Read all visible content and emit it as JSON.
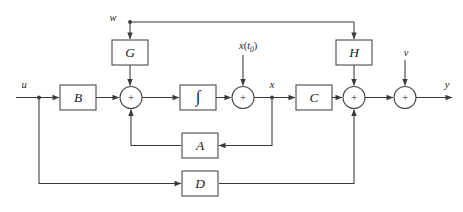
{
  "diagram": {
    "type": "control-block-diagram",
    "colors": {
      "background": "#ffffff",
      "wire": "#3a3a3a",
      "block_stroke": "#4a4a4a",
      "block_fill": "#ffffff",
      "text": "#1d1d1d"
    },
    "blocks": [
      {
        "id": "G",
        "label": "G",
        "x": 112,
        "y": 40,
        "w": 36,
        "h": 25
      },
      {
        "id": "H",
        "label": "H",
        "x": 336,
        "y": 40,
        "w": 36,
        "h": 25
      },
      {
        "id": "B",
        "label": "B",
        "x": 60,
        "y": 85,
        "w": 36,
        "h": 25
      },
      {
        "id": "I",
        "label": "∫",
        "x": 180,
        "y": 85,
        "w": 36,
        "h": 25
      },
      {
        "id": "C",
        "label": "C",
        "x": 296,
        "y": 85,
        "w": 36,
        "h": 25
      },
      {
        "id": "A",
        "label": "A",
        "x": 182,
        "y": 133,
        "w": 36,
        "h": 25
      },
      {
        "id": "D",
        "label": "D",
        "x": 182,
        "y": 171,
        "w": 36,
        "h": 25
      }
    ],
    "summing_junctions": [
      {
        "id": "sum1",
        "sign": "+",
        "cx": 131,
        "cy": 97.5,
        "r": 11
      },
      {
        "id": "sum2",
        "sign": "+",
        "cx": 243,
        "cy": 97.5,
        "r": 11
      },
      {
        "id": "sum3",
        "sign": "+",
        "cx": 354,
        "cy": 97.5,
        "r": 11
      },
      {
        "id": "sum4",
        "sign": "+",
        "cx": 405,
        "cy": 97.5,
        "r": 11
      }
    ],
    "signals": [
      {
        "id": "u",
        "label": "u",
        "x": 24,
        "y": 85
      },
      {
        "id": "w",
        "label": "w",
        "x": 113,
        "y": 19
      },
      {
        "id": "v",
        "label": "v",
        "x": 406,
        "y": 54
      },
      {
        "id": "y",
        "label": "y",
        "x": 447,
        "y": 85
      },
      {
        "id": "x",
        "label": "x",
        "x": 272,
        "y": 86
      },
      {
        "id": "x_t0",
        "label": "x(t₀)",
        "base": "x",
        "paren_open": "(",
        "sub": "t",
        "sub_index": "0",
        "paren_close": ")",
        "x": 254,
        "y": 47
      }
    ],
    "paths": [
      {
        "id": "u-to-B",
        "from": "u input",
        "to": "B block"
      },
      {
        "id": "B-to-sum1",
        "from": "B block",
        "to": "sum1"
      },
      {
        "id": "w-to-G",
        "from": "w input",
        "to": "G block"
      },
      {
        "id": "G-to-sum1",
        "from": "G block",
        "to": "sum1"
      },
      {
        "id": "sum1-to-integ",
        "from": "sum1",
        "to": "integrator"
      },
      {
        "id": "integ-to-sum2",
        "from": "integrator",
        "to": "sum2"
      },
      {
        "id": "xt0-to-sum2",
        "from": "x(t0) input",
        "to": "sum2"
      },
      {
        "id": "sum2-to-C",
        "from": "sum2 (x signal)",
        "to": "C block"
      },
      {
        "id": "x-branch-to-A",
        "from": "x branch point",
        "to": "A block"
      },
      {
        "id": "A-to-sum1",
        "from": "A block",
        "to": "sum1"
      },
      {
        "id": "C-to-sum3",
        "from": "C block",
        "to": "sum3"
      },
      {
        "id": "H-to-sum3",
        "from": "H block",
        "to": "sum3"
      },
      {
        "id": "topline-to-H",
        "from": "top feedback",
        "to": "H block"
      },
      {
        "id": "u-branch-to-D",
        "from": "u branch point",
        "to": "D block"
      },
      {
        "id": "D-to-sum3",
        "from": "D block",
        "to": "sum3"
      },
      {
        "id": "sum3-to-sum4",
        "from": "sum3",
        "to": "sum4"
      },
      {
        "id": "v-to-sum4",
        "from": "v input",
        "to": "sum4"
      },
      {
        "id": "sum4-to-y",
        "from": "sum4",
        "to": "y output"
      }
    ]
  }
}
